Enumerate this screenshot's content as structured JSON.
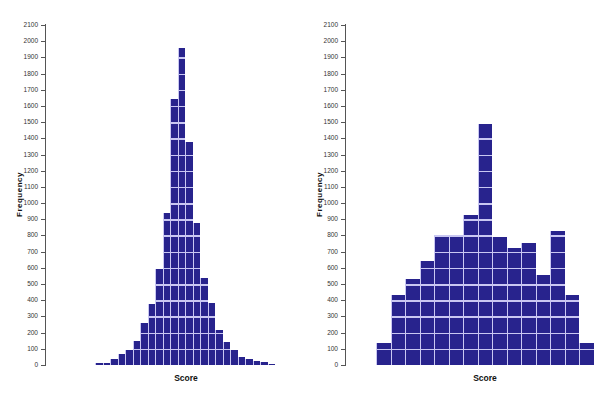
{
  "chart_data": [
    {
      "type": "bar",
      "title": "",
      "xlabel": "Score",
      "ylabel": "Frequency",
      "ylim": [
        0,
        2100
      ],
      "yticks": [
        0,
        100,
        200,
        300,
        400,
        500,
        600,
        700,
        800,
        900,
        1000,
        1100,
        1200,
        1300,
        1400,
        1500,
        1600,
        1700,
        1800,
        1900,
        2000,
        2100
      ],
      "grid": false,
      "legend": null,
      "bar_color": "#28238d",
      "categories": [
        "1",
        "2",
        "3",
        "4",
        "5",
        "6",
        "7",
        "8",
        "9",
        "10",
        "11",
        "12",
        "13",
        "14",
        "15",
        "16",
        "17",
        "18",
        "19",
        "20",
        "21",
        "22",
        "23",
        "24"
      ],
      "values": [
        10,
        12,
        35,
        65,
        90,
        150,
        260,
        375,
        590,
        940,
        1640,
        1960,
        1380,
        880,
        540,
        385,
        215,
        140,
        95,
        50,
        35,
        25,
        18,
        8
      ]
    },
    {
      "type": "bar",
      "title": "",
      "xlabel": "Score",
      "ylabel": "Frequency",
      "ylim": [
        0,
        2100
      ],
      "yticks": [
        0,
        100,
        200,
        300,
        400,
        500,
        600,
        700,
        800,
        900,
        1000,
        1100,
        1200,
        1300,
        1400,
        1500,
        1600,
        1700,
        1800,
        1900,
        2000,
        2100
      ],
      "grid": false,
      "legend": null,
      "bar_color": "#28238d",
      "categories": [
        "1",
        "2",
        "3",
        "4",
        "5",
        "6",
        "7",
        "8",
        "9",
        "10",
        "11",
        "12",
        "13",
        "14",
        "15"
      ],
      "values": [
        135,
        435,
        530,
        645,
        800,
        800,
        925,
        1490,
        790,
        725,
        755,
        555,
        825,
        435,
        135
      ]
    }
  ],
  "charts": {
    "left": {
      "ylabel": "Frequency",
      "xlabel": "Score"
    },
    "right": {
      "ylabel": "Frequency",
      "xlabel": "Score"
    }
  }
}
